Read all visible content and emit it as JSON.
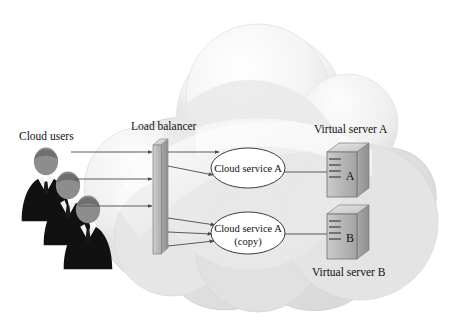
{
  "diagram": {
    "type": "cloud-architecture-diagram"
  },
  "labels": {
    "cloud_users": "Cloud users",
    "load_balancer": "Load balancer",
    "virtual_server_a": "Virtual server A",
    "virtual_server_b": "Virtual server B"
  },
  "services": [
    {
      "name": "service-a",
      "line1": "Cloud service A",
      "line2": ""
    },
    {
      "name": "service-a-copy",
      "line1": "Cloud service A",
      "line2": "(copy)"
    }
  ],
  "servers": [
    {
      "name": "virtual-server-a",
      "letter": "A",
      "label": "Virtual server A",
      "label_position": "above"
    },
    {
      "name": "virtual-server-b",
      "letter": "B",
      "label": "Virtual server B",
      "label_position": "below"
    }
  ],
  "users": {
    "count": 3,
    "icon": "business-person-silhouette"
  },
  "connections": {
    "users_to_balancer": 3,
    "balancer_to_service_a": 2,
    "balancer_to_service_a_copy": 3,
    "service_a_to_server_a": 1,
    "service_a_copy_to_server_b": 1
  },
  "colors": {
    "cloud_fill_light": "#fbfbfb",
    "cloud_fill_mid": "#e3e3e3",
    "cloud_fill_dark": "#cfcfcf",
    "cloud_edge": "#d2d2d2",
    "line": "#5a5a5a",
    "text": "#111111",
    "ellipse_fill": "#ffffff",
    "ellipse_stroke": "#3c3c3c",
    "box_face": "#b9b9b9",
    "box_top": "#dcdcdc",
    "box_side": "#9b9b9b",
    "suit_dark": "#111111",
    "head_gray": "#8d8d8d",
    "shirt_white": "#f2f2f2"
  }
}
